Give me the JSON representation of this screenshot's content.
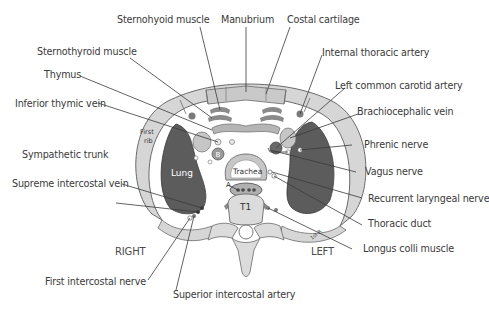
{
  "diagram": {
    "orientation": {
      "right": "RIGHT",
      "left": "LEFT"
    },
    "inner_labels": {
      "lung": "Lung",
      "trachea": "Trachea",
      "vertebra": "T1",
      "first_rib_line1": "First",
      "first_rib_line2": "rib",
      "brachiocephalic_trunk": "B",
      "aorta_marker": "A",
      "first_rib_right": "1st R"
    },
    "labels": [
      {
        "id": "sternohyoid-muscle",
        "text": "Sternohyoid muscle"
      },
      {
        "id": "manubrium",
        "text": "Manubrium"
      },
      {
        "id": "costal-cartilage",
        "text": "Costal cartilage"
      },
      {
        "id": "sternothyroid-muscle",
        "text": "Sternothyroid muscle"
      },
      {
        "id": "internal-thoracic-artery",
        "text": "Internal thoracic artery"
      },
      {
        "id": "thymus",
        "text": "Thymus"
      },
      {
        "id": "left-common-carotid-artery",
        "text": "Left common carotid artery"
      },
      {
        "id": "inferior-thymic-vein",
        "text": "Inferior thymic vein"
      },
      {
        "id": "brachiocephalic-vein",
        "text": "Brachiocephalic vein"
      },
      {
        "id": "phrenic-nerve",
        "text": "Phrenic nerve"
      },
      {
        "id": "sympathetic-trunk",
        "text": "Sympathetic trunk"
      },
      {
        "id": "vagus-nerve",
        "text": "Vagus nerve"
      },
      {
        "id": "supreme-intercostal-vein",
        "text": "Supreme intercostal vein"
      },
      {
        "id": "recurrent-laryngeal-nerve",
        "text": "Recurrent laryngeal nerve"
      },
      {
        "id": "thoracic-duct",
        "text": "Thoracic duct"
      },
      {
        "id": "longus-colli-muscle",
        "text": "Longus colli muscle"
      },
      {
        "id": "first-intercostal-nerve",
        "text": "First intercostal nerve"
      },
      {
        "id": "superior-intercostal-artery",
        "text": "Superior intercostal artery"
      }
    ],
    "colors": {
      "rib": "#d6d6d6",
      "rib_outline": "#6a6a6a",
      "lung": "#5c5c5c",
      "muscle": "#8a8a8a",
      "bone": "#dcdcdc",
      "vessel": "#bdbdbd",
      "leader": "#3a3a3a",
      "text": "#3a3a3a"
    }
  }
}
